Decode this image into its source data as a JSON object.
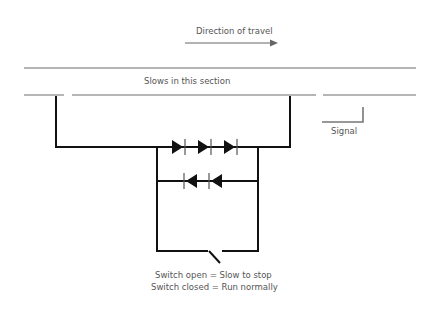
{
  "labels": {
    "direction": "Direction of travel",
    "section": "Slows in this section",
    "signal": "Signal",
    "switch_open": "Switch open = Slow to stop",
    "switch_closed": "Switch closed = Run normally"
  },
  "colors": {
    "rail": "#b0b0b0",
    "wire": "#111111",
    "arrow": "#666666",
    "signal": "#777777",
    "text": "#555555"
  }
}
